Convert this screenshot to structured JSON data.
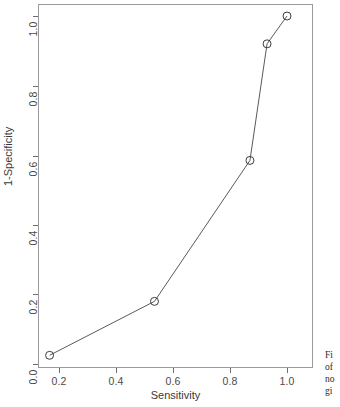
{
  "figure": {
    "background_color": "#ffffff",
    "frame_color": "#9a9a9a",
    "ink_color": "#4a4a4a"
  },
  "chart_data": {
    "type": "line",
    "title": "",
    "subtitle": "",
    "xlabel": "Sensitivity",
    "ylabel": "1-Specificity",
    "xlim": [
      0.13,
      1.03
    ],
    "ylim": [
      -0.015,
      1.04
    ],
    "xticks": [
      0.2,
      0.4,
      0.6,
      0.8,
      1.0
    ],
    "xtick_labels": [
      "0.2",
      "0.4",
      "0.6",
      "0.8",
      "1.0"
    ],
    "yticks": [
      0.0,
      0.2,
      0.4,
      0.6,
      0.8,
      1.0
    ],
    "ytick_labels": [
      "0.0",
      "0.2",
      "0.4",
      "0.6",
      "0.8",
      "1.0"
    ],
    "grid": false,
    "legend": null,
    "marker": "open-circle",
    "marker_size": 4,
    "line_color": "#5a5a5a",
    "series": [
      {
        "name": "ROC curve",
        "x": [
          0.167,
          0.535,
          0.87,
          0.93,
          1.0
        ],
        "y": [
          0.025,
          0.18,
          0.585,
          0.92,
          1.0
        ]
      }
    ],
    "annotations": []
  },
  "caption": {
    "clipped_lines": [
      "Fi",
      "of",
      "no",
      "gi"
    ]
  }
}
